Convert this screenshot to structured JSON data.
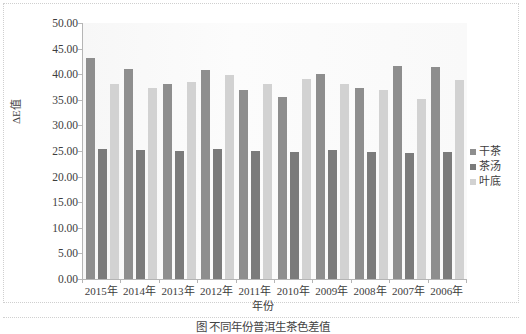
{
  "chart_data": {
    "type": "bar",
    "title": "",
    "xlabel": "年份",
    "ylabel": "ΔE值",
    "categories": [
      "2015年",
      "2014年",
      "2013年",
      "2012年",
      "2011年",
      "2010年",
      "2009年",
      "2008年",
      "2007年",
      "2006年"
    ],
    "series": [
      {
        "name": "干茶",
        "color": "#8e8e8e",
        "values": [
          43.1,
          41.1,
          38.1,
          40.8,
          36.9,
          35.6,
          40.1,
          37.4,
          41.7,
          41.5
        ]
      },
      {
        "name": "茶汤",
        "color": "#7b7b7b",
        "values": [
          25.4,
          25.2,
          25.0,
          25.4,
          25.1,
          24.8,
          25.2,
          24.8,
          24.7,
          24.8
        ]
      },
      {
        "name": "叶底",
        "color": "#d2d2d2",
        "values": [
          38.0,
          37.3,
          38.4,
          39.8,
          38.0,
          39.0,
          38.1,
          36.9,
          35.2,
          38.8
        ]
      }
    ],
    "ylim": [
      0,
      50
    ],
    "ytick_step": 5,
    "ytick_labels": [
      "50.00",
      "45.00",
      "40.00",
      "35.00",
      "30.00",
      "25.00",
      "20.00",
      "15.00",
      "10.00",
      "5.00",
      "0.00"
    ],
    "grid": false,
    "legend_position": "right"
  },
  "caption": "图 不同年份普洱生茶色差值",
  "legend_title": ""
}
